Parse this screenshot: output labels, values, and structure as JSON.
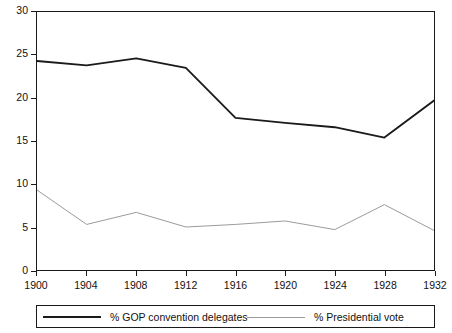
{
  "chart_data": {
    "type": "line",
    "title": "",
    "subtitle": "",
    "xlabel": "",
    "ylabel": "",
    "xlim": [
      1900,
      1932
    ],
    "ylim": [
      0,
      30
    ],
    "grid": false,
    "legend_position": "bottom",
    "categories": [
      "1900",
      "1904",
      "1908",
      "1912",
      "1916",
      "1920",
      "1924",
      "1928",
      "1932"
    ],
    "x": [
      1900,
      1904,
      1908,
      1912,
      1916,
      1920,
      1924,
      1928,
      1932
    ],
    "y_ticks": [
      "0",
      "5",
      "10",
      "15",
      "20",
      "25",
      "30"
    ],
    "y_tick_values": [
      0,
      5,
      10,
      15,
      20,
      25,
      30
    ],
    "x_ticks": [
      "1900",
      "1904",
      "1908",
      "1912",
      "1916",
      "1920",
      "1924",
      "1928",
      "1932"
    ],
    "series": [
      {
        "name": "% GOP convention delegates",
        "color": "#1a1a1a",
        "width": 1.8,
        "values": [
          24.3,
          23.8,
          24.6,
          23.5,
          17.7,
          17.1,
          16.6,
          15.4,
          19.7
        ]
      },
      {
        "name": "% Presidential vote",
        "color": "#9b9b9b",
        "width": 1.0,
        "values": [
          9.3,
          5.3,
          6.7,
          5.0,
          5.3,
          5.7,
          4.7,
          7.6,
          4.6
        ]
      }
    ]
  },
  "legend": {
    "entries": [
      {
        "label": "% GOP convention delegates"
      },
      {
        "label": "% Presidential vote"
      }
    ]
  },
  "colors": {
    "series_dark": "#1a1a1a",
    "series_light": "#9b9b9b",
    "axis": "#1a1a1a",
    "background": "#ffffff"
  }
}
